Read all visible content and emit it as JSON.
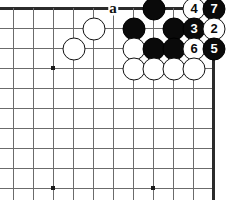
{
  "diagram": {
    "type": "go-board-diagram",
    "board": {
      "origin_x": 13,
      "origin_y": 8,
      "spacing": 20,
      "cols": 11,
      "rows": 10,
      "edges": [
        "top",
        "right"
      ],
      "grid_color": "#6b6b6b",
      "edge_color": "#2b2b2b",
      "background": "#ffffff"
    },
    "star_points": [
      {
        "col": 2,
        "row": 3
      },
      {
        "col": 2,
        "row": 9
      },
      {
        "col": 7,
        "row": 9
      }
    ],
    "stones": [
      {
        "col": 7,
        "row": 0,
        "color": "black",
        "number": ""
      },
      {
        "col": 9,
        "row": 0,
        "color": "white",
        "number": "4"
      },
      {
        "col": 10,
        "row": 0,
        "color": "black",
        "number": "7"
      },
      {
        "col": 4,
        "row": 1,
        "color": "white",
        "number": ""
      },
      {
        "col": 6,
        "row": 1,
        "color": "black",
        "number": ""
      },
      {
        "col": 8,
        "row": 1,
        "color": "black",
        "number": ""
      },
      {
        "col": 9,
        "row": 1,
        "color": "black",
        "number": "3"
      },
      {
        "col": 10,
        "row": 1,
        "color": "white",
        "number": "2"
      },
      {
        "col": 3,
        "row": 2,
        "color": "white",
        "number": ""
      },
      {
        "col": 6,
        "row": 2,
        "color": "white",
        "number": ""
      },
      {
        "col": 7,
        "row": 2,
        "color": "black",
        "number": ""
      },
      {
        "col": 8,
        "row": 2,
        "color": "black",
        "number": ""
      },
      {
        "col": 9,
        "row": 2,
        "color": "white",
        "number": "6"
      },
      {
        "col": 10,
        "row": 2,
        "color": "black",
        "number": "5"
      },
      {
        "col": 6,
        "row": 3,
        "color": "white",
        "number": ""
      },
      {
        "col": 7,
        "row": 3,
        "color": "white",
        "number": ""
      },
      {
        "col": 8,
        "row": 3,
        "color": "white",
        "number": ""
      },
      {
        "col": 9,
        "row": 3,
        "color": "white",
        "number": ""
      }
    ],
    "labels": [
      {
        "col": 5,
        "row": 0,
        "text": "a"
      }
    ]
  }
}
